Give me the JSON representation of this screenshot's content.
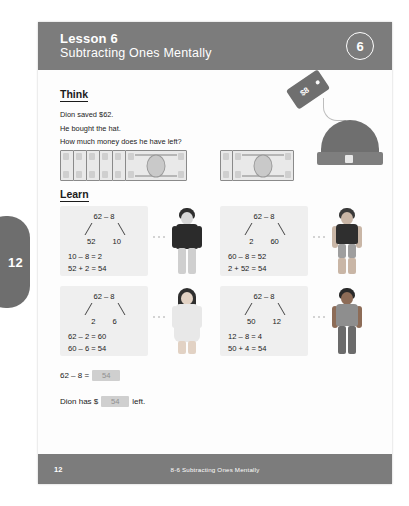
{
  "side_tab": {
    "number": "12"
  },
  "header": {
    "lesson_label": "Lesson 6",
    "lesson_title": "Subtracting Ones Mentally",
    "badge_number": "6"
  },
  "think": {
    "heading": "Think",
    "lines": [
      "Dion saved $62.",
      "He bought the hat.",
      "How much money does he have left?"
    ],
    "price_tag": "$8"
  },
  "money": {
    "tens_count": 6,
    "ones_count": 2,
    "tens_label": "$10",
    "ones_label": "$1",
    "total": "$62"
  },
  "learn": {
    "heading": "Learn",
    "cells": [
      {
        "expression": "62 – 8",
        "part_left": "52",
        "part_right": "10",
        "steps": [
          "10 – 8 = 2",
          "52 + 2 = 54"
        ],
        "figure": "boy-dark-sweater"
      },
      {
        "expression": "62 – 8",
        "part_left": "2",
        "part_right": "60",
        "steps": [
          "60 – 8 = 52",
          "2 + 52 = 54"
        ],
        "figure": "boy-dark-shirt"
      },
      {
        "expression": "62 – 8",
        "part_left": "2",
        "part_right": "6",
        "steps": [
          "62 – 2 = 60",
          "60 – 6 = 54"
        ],
        "figure": "girl-long-hair"
      },
      {
        "expression": "62 – 8",
        "part_left": "50",
        "part_right": "12",
        "steps": [
          "12 – 8 = 4",
          "50 + 4 = 54"
        ],
        "figure": "boy-grey-shirt"
      }
    ]
  },
  "answers": {
    "line1_prefix": "62 – 8 =",
    "line1_value": "54",
    "line2_prefix": "Dion has $",
    "line2_value": "54",
    "line2_suffix": "left."
  },
  "footer": {
    "page_number": "12",
    "title": "8-6  Subtracting Ones Mentally"
  },
  "colors": {
    "band": "#7c7c7c",
    "tab": "#6e6e6e",
    "work_box": "#efefef",
    "answer_box": "#cfcfcf",
    "paper": "#fdfdfd"
  }
}
